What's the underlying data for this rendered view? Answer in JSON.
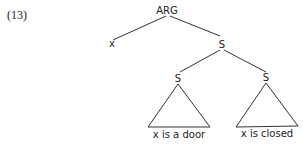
{
  "example_number": "(13)",
  "tree": {
    "root": {
      "label": "ARG"
    },
    "left_child": {
      "label": "x"
    },
    "right_child": {
      "label": "S"
    },
    "subtree_left": {
      "label": "S",
      "content": "x is a door"
    },
    "subtree_right": {
      "label": "S",
      "content": "x is closed"
    }
  }
}
